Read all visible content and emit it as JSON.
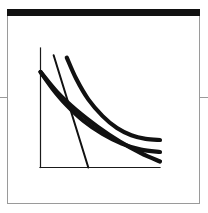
{
  "figure": {
    "title": "",
    "header_bar_color": "#111111",
    "frame_border_color": "#9a9a9a",
    "background_color": "#ffffff"
  },
  "edge_ticks": {
    "left_label": "",
    "right_label": ""
  },
  "chart_data": {
    "type": "line",
    "title": "",
    "xlabel": "",
    "ylabel": "",
    "xlim": [
      0,
      100
    ],
    "ylim": [
      0,
      100
    ],
    "grid": false,
    "legend": "none",
    "axis_color": "#1a1a1a",
    "curve_color": "#111111",
    "series": [
      {
        "name": "curve-upper",
        "style": "thick",
        "x": [
          22,
          30,
          40,
          52,
          64,
          76,
          88,
          100
        ],
        "y": [
          92,
          74,
          57,
          43,
          33,
          27,
          24,
          23
        ]
      },
      {
        "name": "curve-middle",
        "style": "thick",
        "x": [
          0,
          10,
          22,
          36,
          52,
          68,
          84,
          100
        ],
        "y": [
          80,
          66,
          52,
          39,
          28,
          20,
          15,
          13
        ]
      },
      {
        "name": "curve-lower-steep",
        "style": "thick",
        "x": [
          0,
          14,
          30,
          48,
          66,
          84,
          100
        ],
        "y": [
          80,
          63,
          48,
          34,
          22,
          12,
          5
        ]
      },
      {
        "name": "line-steep-thin",
        "style": "thin",
        "x": [
          11,
          40
        ],
        "y": [
          94,
          0
        ]
      }
    ]
  }
}
